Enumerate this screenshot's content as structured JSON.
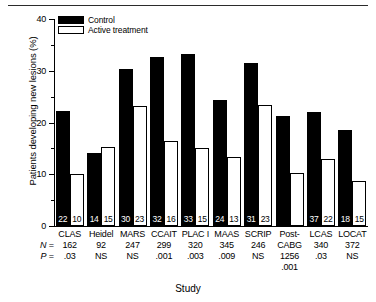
{
  "figure": {
    "rule": "horizontal-rule",
    "axis_title_x": "Study",
    "axis_title_y": "Patients developing new lesions (%)"
  },
  "legend": {
    "position": "top-left-inside",
    "entries": [
      {
        "label": "Control",
        "style": "filled-black",
        "color": "#000000"
      },
      {
        "label": "Active treatment",
        "style": "hollow-white",
        "color": "#ffffff"
      }
    ]
  },
  "yaxis": {
    "ticks": [
      "0",
      "10",
      "20",
      "30",
      "40"
    ],
    "tick_values": [
      0,
      10,
      20,
      30,
      40
    ],
    "minor_tick_values": [
      5,
      15,
      25,
      35
    ],
    "min": 0,
    "max": 40
  },
  "rows": {
    "n_label": "N",
    "n_eq": "=",
    "p_label": "P",
    "p_eq": "="
  },
  "chart_data": {
    "type": "bar",
    "title": "",
    "xlabel": "Study",
    "ylabel": "Patients developing new lesions (%)",
    "ylim": [
      0,
      40
    ],
    "yticks": [
      0,
      10,
      20,
      30,
      40
    ],
    "grid": false,
    "legend_position": "upper left",
    "categories": [
      "CLAS",
      "Heidel",
      "MARS",
      "CCAIT",
      "PLAC I",
      "MAAS",
      "SCRIP",
      "Post-\nCABG",
      "LCAS",
      "LOCAT"
    ],
    "series": [
      {
        "name": "Control",
        "color": "#000000",
        "values": [
          22.2,
          14.2,
          30.3,
          32.7,
          33.3,
          24.3,
          31.5,
          21.2,
          22.0,
          18.5
        ],
        "labels": [
          "22",
          "14",
          "30",
          "32",
          "33",
          "24",
          "31",
          "",
          "37",
          "18"
        ]
      },
      {
        "name": "Active treatment",
        "color": "#ffffff",
        "values": [
          10.1,
          15.2,
          23.2,
          16.5,
          15.1,
          13.4,
          23.3,
          10.2,
          13.0,
          8.7
        ],
        "labels": [
          "10",
          "15",
          "23",
          "16",
          "15",
          "13",
          "23",
          "",
          "22",
          "15"
        ]
      }
    ],
    "annotations": {
      "N": [
        "162",
        "92",
        "247",
        "299",
        "320",
        "345",
        "246",
        "1256",
        "340",
        "372"
      ],
      "P": [
        ".03",
        "NS",
        "NS",
        ".001",
        ".003",
        ".009",
        "NS",
        ".001",
        ".03",
        "NS"
      ]
    }
  }
}
